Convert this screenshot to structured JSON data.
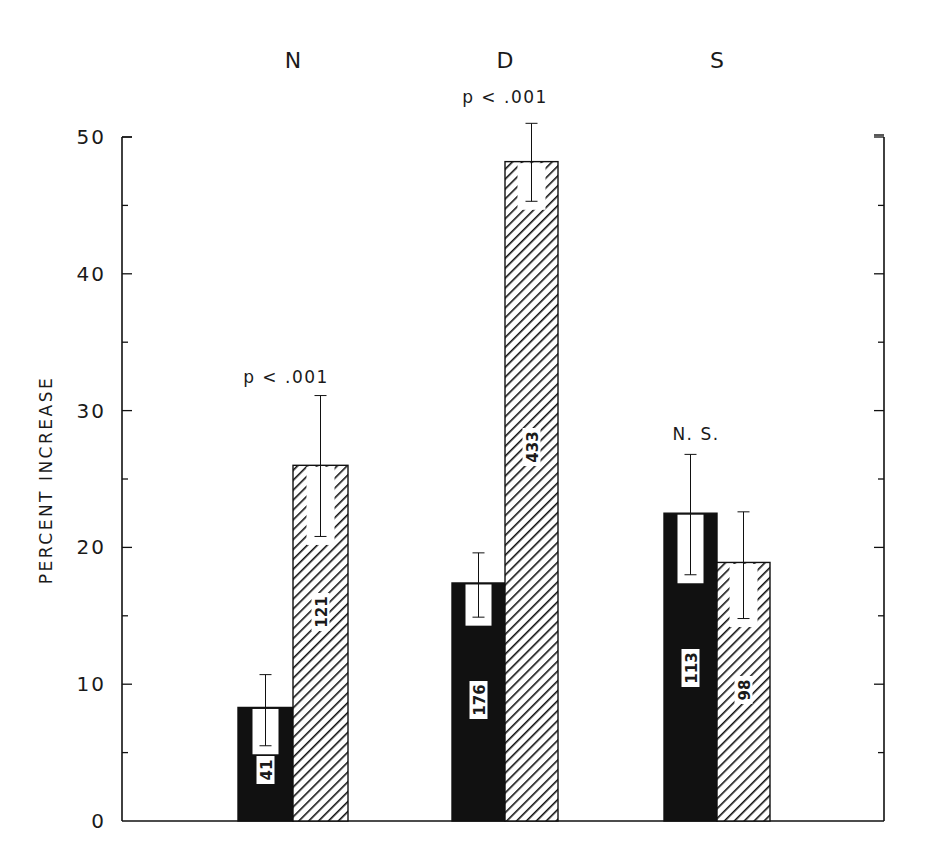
{
  "chart_data": {
    "type": "bar",
    "title": "",
    "xlabel": "",
    "ylabel": "PERCENT INCREASE",
    "ylim": [
      0,
      50
    ],
    "yticks": [
      0,
      10,
      20,
      30,
      40,
      50
    ],
    "minor_tick_step": 5,
    "grid": false,
    "legend": null,
    "categories": [
      "N",
      "D",
      "S"
    ],
    "series": [
      {
        "name": "solid",
        "fill": "black",
        "values": [
          8.3,
          17.4,
          22.5
        ],
        "error_low": [
          5.5,
          14.9,
          18.0
        ],
        "error_high": [
          10.7,
          19.6,
          26.8
        ],
        "n_labels": [
          "41",
          "176",
          "113"
        ]
      },
      {
        "name": "hatched",
        "fill": "diagonal-hatch",
        "values": [
          26.0,
          48.2,
          18.9
        ],
        "error_low": [
          20.8,
          45.3,
          14.8
        ],
        "error_high": [
          31.1,
          51.0,
          22.6
        ],
        "n_labels": [
          "121",
          "433",
          "98"
        ]
      }
    ],
    "annotations": [
      {
        "category": "N",
        "text": "p < .001"
      },
      {
        "category": "D",
        "text": "p < .001"
      },
      {
        "category": "S",
        "text": "N. S."
      }
    ]
  },
  "colors": {
    "ink": "#111111",
    "background": "#ffffff"
  }
}
